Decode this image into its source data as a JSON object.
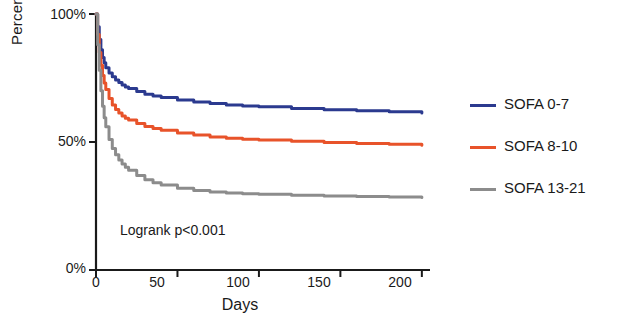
{
  "chart_data": {
    "type": "line",
    "title": "",
    "xlabel": "Days",
    "ylabel": "Percent survival",
    "xlim": [
      0,
      205
    ],
    "ylim": [
      0,
      100
    ],
    "xticks": [
      "0",
      "50",
      "100",
      "150",
      "200"
    ],
    "xtick_values": [
      0,
      50,
      100,
      150,
      200
    ],
    "yticks": [
      "0%",
      "50%",
      "100%"
    ],
    "ytick_values": [
      0,
      50,
      100
    ],
    "grid": false,
    "legend_position": "right",
    "annotation": "Logrank p<0.001",
    "series": [
      {
        "name": "SOFA 0-7",
        "color": "#2b3a8f",
        "x": [
          0,
          1,
          2,
          3,
          4,
          5,
          6,
          8,
          10,
          12,
          14,
          16,
          18,
          20,
          25,
          30,
          35,
          40,
          50,
          60,
          70,
          80,
          90,
          100,
          120,
          140,
          160,
          180,
          200
        ],
        "y": [
          100,
          95,
          90,
          86,
          83,
          81,
          79,
          77,
          75.5,
          74.2,
          73.2,
          72.3,
          71.5,
          70.9,
          69.7,
          68.7,
          68.0,
          67.4,
          66.4,
          65.6,
          65.0,
          64.5,
          64.1,
          63.8,
          63.1,
          62.6,
          62.2,
          61.8,
          61.3
        ]
      },
      {
        "name": "SOFA 8-10",
        "color": "#e8532a",
        "x": [
          0,
          1,
          2,
          3,
          4,
          5,
          6,
          8,
          10,
          12,
          14,
          16,
          18,
          20,
          25,
          30,
          35,
          40,
          50,
          60,
          70,
          80,
          90,
          100,
          120,
          140,
          160,
          180,
          200
        ],
        "y": [
          100,
          92,
          85,
          80,
          76,
          73,
          70.5,
          67,
          64.5,
          62.7,
          61.3,
          60.2,
          59.3,
          58.6,
          57.2,
          56.1,
          55.3,
          54.6,
          53.5,
          52.7,
          52.0,
          51.5,
          51.1,
          50.8,
          50.3,
          49.8,
          49.4,
          49.1,
          48.7
        ]
      },
      {
        "name": "SOFA 13-21",
        "color": "#8c8c8c",
        "x": [
          0,
          1,
          2,
          3,
          4,
          5,
          6,
          8,
          10,
          12,
          14,
          16,
          18,
          20,
          25,
          30,
          35,
          40,
          50,
          60,
          70,
          80,
          90,
          100,
          120,
          140,
          160,
          180,
          200
        ],
        "y": [
          100,
          88,
          78,
          70,
          64,
          59.5,
          56,
          51,
          47.5,
          45,
          43,
          41.4,
          40.1,
          39.0,
          36.9,
          35.3,
          34.1,
          33.2,
          31.9,
          31.1,
          30.5,
          30.1,
          29.8,
          29.6,
          29.2,
          28.9,
          28.7,
          28.5,
          28.3
        ]
      }
    ]
  },
  "legend": [
    {
      "label": "SOFA 0-7",
      "color": "#2b3a8f"
    },
    {
      "label": "SOFA 8-10",
      "color": "#e8532a"
    },
    {
      "label": "SOFA 13-21",
      "color": "#8c8c8c"
    }
  ],
  "axis": {
    "x_title": "Days",
    "y_title": "Percent survival"
  }
}
